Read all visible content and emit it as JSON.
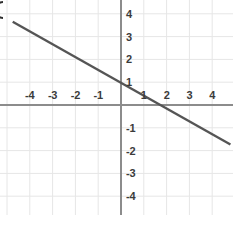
{
  "chart_data": {
    "type": "line",
    "title": "",
    "xlabel": "",
    "ylabel": "",
    "xlim": [
      -5.2,
      4.85
    ],
    "ylim": [
      -5.35,
      4.55
    ],
    "grid": true,
    "grid_spacing": 1,
    "legend": false,
    "axis_color": "#8c8c8c",
    "grid_color": "#e6e6e6",
    "line_color": "#555555",
    "label_color": "#3b3b3b",
    "background": "#ffffff",
    "series": [
      {
        "name": "line",
        "slope": -0.56,
        "y_intercept": 1,
        "x_intercept": 1.1,
        "points": [
          {
            "x": -4.75,
            "y": 3.65
          },
          {
            "x": 4.8,
            "y": -1.73
          }
        ]
      }
    ],
    "x_ticks": [
      {
        "value": -4,
        "label": "-4"
      },
      {
        "value": -3,
        "label": "-3"
      },
      {
        "value": -2,
        "label": "-2"
      },
      {
        "value": -1,
        "label": "-1"
      },
      {
        "value": 1,
        "label": "1"
      },
      {
        "value": 2,
        "label": "2"
      },
      {
        "value": 3,
        "label": "3"
      },
      {
        "value": 4,
        "label": "4"
      }
    ],
    "y_ticks": [
      {
        "value": 4,
        "label": "4"
      },
      {
        "value": 3,
        "label": "3"
      },
      {
        "value": 2,
        "label": "2"
      },
      {
        "value": 1,
        "label": "1"
      },
      {
        "value": -1,
        "label": "-1"
      },
      {
        "value": -2,
        "label": "-2"
      },
      {
        "value": -3,
        "label": "-3"
      },
      {
        "value": -4,
        "label": "-4"
      }
    ]
  }
}
